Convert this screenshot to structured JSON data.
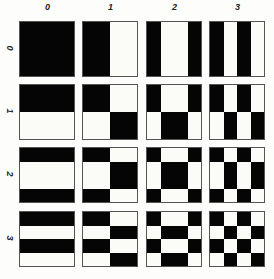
{
  "figure": {
    "type": "walsh-hadamard-basis-grid",
    "column_labels": [
      "0",
      "1",
      "2",
      "3"
    ],
    "row_labels": [
      "0",
      "1",
      "2",
      "3"
    ],
    "colors": {
      "black": "#050505",
      "white": "#fbfbf7",
      "border": "#555555"
    },
    "walsh_patterns": [
      [
        1,
        1,
        1,
        1
      ],
      [
        1,
        1,
        0,
        0
      ],
      [
        1,
        0,
        0,
        1
      ],
      [
        1,
        0,
        1,
        0
      ]
    ],
    "cell_rule": "pixel(i,j) black when walsh[row][i] == walsh[col][j]"
  }
}
